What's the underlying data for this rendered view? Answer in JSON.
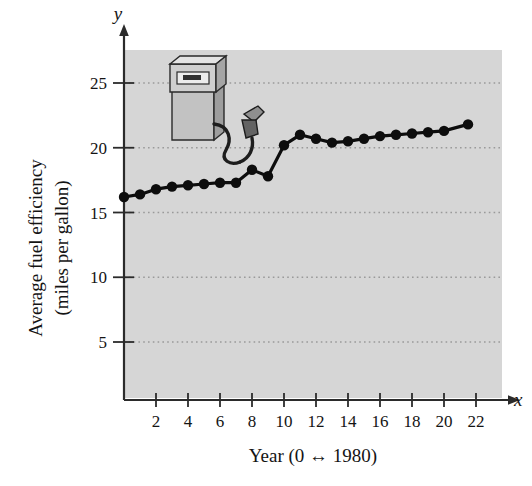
{
  "figure": {
    "plot_background_color": "#d6d6d6",
    "axis_color": "#2b2b2b",
    "marker_color": "#0d0d0d",
    "gridline_color": "#9a9a9a",
    "x_axis_variable": "x",
    "y_axis_variable": "y",
    "illustration": {
      "name": "gas-pump-illustration",
      "body_color": "#c9c9c9",
      "shade_color": "#9d9d9d",
      "outline_color": "#2a2a2a",
      "screen_color": "#e8e8e8",
      "hose_color": "#1d1d1d"
    }
  },
  "chart_data": {
    "type": "line",
    "title": "",
    "xlabel": "Year (0 ↔ 1980)",
    "ylabel": "Average fuel efficiency (miles per gallon)",
    "ylabel_line1": "Average fuel efficiency",
    "ylabel_line2": "(miles per gallon)",
    "xlim": [
      -0.6,
      23.2
    ],
    "ylim": [
      0,
      27
    ],
    "xticks": [
      2,
      4,
      6,
      8,
      10,
      12,
      14,
      16,
      18,
      20,
      22
    ],
    "xtick_labels": [
      "2",
      "4",
      "6",
      "8",
      "10",
      "12",
      "14",
      "16",
      "18",
      "20",
      "22"
    ],
    "yticks": [
      5,
      10,
      15,
      20,
      25
    ],
    "ytick_labels": [
      "5",
      "10",
      "15",
      "20",
      "25"
    ],
    "grid": "horizontal-dotted",
    "legend": "none",
    "marker": "filled-circle",
    "x": [
      0,
      1,
      2,
      3,
      4,
      5,
      6,
      7,
      8,
      9,
      10,
      11,
      12,
      13,
      14,
      15,
      16,
      17,
      18,
      19,
      20,
      21.5
    ],
    "values": [
      16.2,
      16.4,
      16.8,
      17.0,
      17.1,
      17.2,
      17.3,
      17.3,
      18.3,
      17.8,
      20.2,
      21.0,
      20.7,
      20.4,
      20.5,
      20.7,
      20.9,
      21.0,
      21.1,
      21.2,
      21.3,
      21.8
    ],
    "series": [
      {
        "name": "Average fuel efficiency",
        "values": [
          16.2,
          16.4,
          16.8,
          17.0,
          17.1,
          17.2,
          17.3,
          17.3,
          18.3,
          17.8,
          20.2,
          21.0,
          20.7,
          20.4,
          20.5,
          20.7,
          20.9,
          21.0,
          21.1,
          21.2,
          21.3,
          21.8
        ]
      }
    ]
  }
}
